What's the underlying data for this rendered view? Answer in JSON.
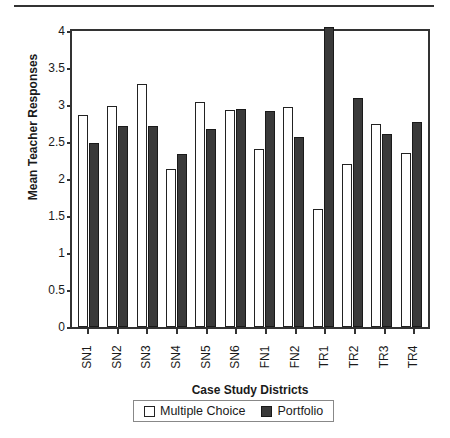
{
  "chart_data": {
    "type": "bar",
    "title": "",
    "xlabel": "Case Study Districts",
    "ylabel": "Mean Teacher Responses",
    "ylim": [
      0,
      4
    ],
    "yticks": [
      "0",
      "0.5",
      "1",
      "1.5",
      "2",
      "2.5",
      "3",
      "3.5",
      "4"
    ],
    "ytick_values": [
      0,
      0.5,
      1,
      1.5,
      2,
      2.5,
      3,
      3.5,
      4
    ],
    "grid": false,
    "legend_position": "bottom",
    "categories": [
      "SN1",
      "SN2",
      "SN3",
      "SN4",
      "SN5",
      "SN6",
      "FN1",
      "FN2",
      "TR1",
      "TR2",
      "TR3",
      "TR4"
    ],
    "series": [
      {
        "name": "Multiple Choice",
        "color": "#ffffff",
        "values": [
          2.87,
          2.98,
          3.29,
          2.14,
          3.04,
          2.93,
          2.41,
          2.97,
          1.6,
          2.2,
          2.74,
          2.35
        ]
      },
      {
        "name": "Portfolio",
        "color": "#3a3a3a",
        "values": [
          2.48,
          2.72,
          2.71,
          2.34,
          2.68,
          2.94,
          2.92,
          2.57,
          4.0,
          3.09,
          2.61,
          2.77
        ]
      }
    ]
  },
  "legend": {
    "entries": [
      {
        "label": "Multiple Choice",
        "swatch": "white-square"
      },
      {
        "label": "Portfolio",
        "swatch": "dark-square"
      }
    ]
  },
  "colors": {
    "axis": "#333333",
    "multiple_choice": "#ffffff",
    "portfolio": "#3a3a3a",
    "background": "#ffffff"
  }
}
